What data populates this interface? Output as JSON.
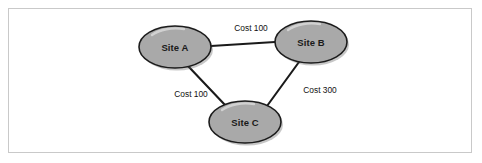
{
  "figure": {
    "type": "network-topology-diagram",
    "background_color": "#ffffff",
    "frame_color": "#c9c9c9",
    "node_fill_color": "#a9a9a9",
    "node_stroke_color": "#1c1c1c",
    "edge_color": "#1a1a1a",
    "label_color": "#111111"
  },
  "nodes": [
    {
      "id": "site-a",
      "label": "Site A",
      "cx": 175,
      "cy": 47,
      "rx": 36,
      "ry": 21
    },
    {
      "id": "site-b",
      "label": "Site B",
      "cx": 311,
      "cy": 42,
      "rx": 36,
      "ry": 21
    },
    {
      "id": "site-c",
      "label": "Site C",
      "cx": 245,
      "cy": 122,
      "rx": 36,
      "ry": 21
    }
  ],
  "edges": [
    {
      "id": "edge-a-b",
      "from": "site-a",
      "to": "site-b",
      "label": "Cost 100",
      "cost": 100,
      "x1": 211,
      "y1": 46,
      "x2": 275,
      "y2": 42,
      "label_x": 251,
      "label_y": 31
    },
    {
      "id": "edge-a-c",
      "from": "site-a",
      "to": "site-c",
      "label": "Cost 100",
      "cost": 100,
      "x1": 188,
      "y1": 66,
      "x2": 225,
      "y2": 105,
      "label_x": 191,
      "label_y": 97
    },
    {
      "id": "edge-b-c",
      "from": "site-b",
      "to": "site-c",
      "label": "Cost 300",
      "cost": 300,
      "x1": 299,
      "y1": 62,
      "x2": 268,
      "y2": 105,
      "label_x": 303,
      "label_y": 93
    }
  ]
}
